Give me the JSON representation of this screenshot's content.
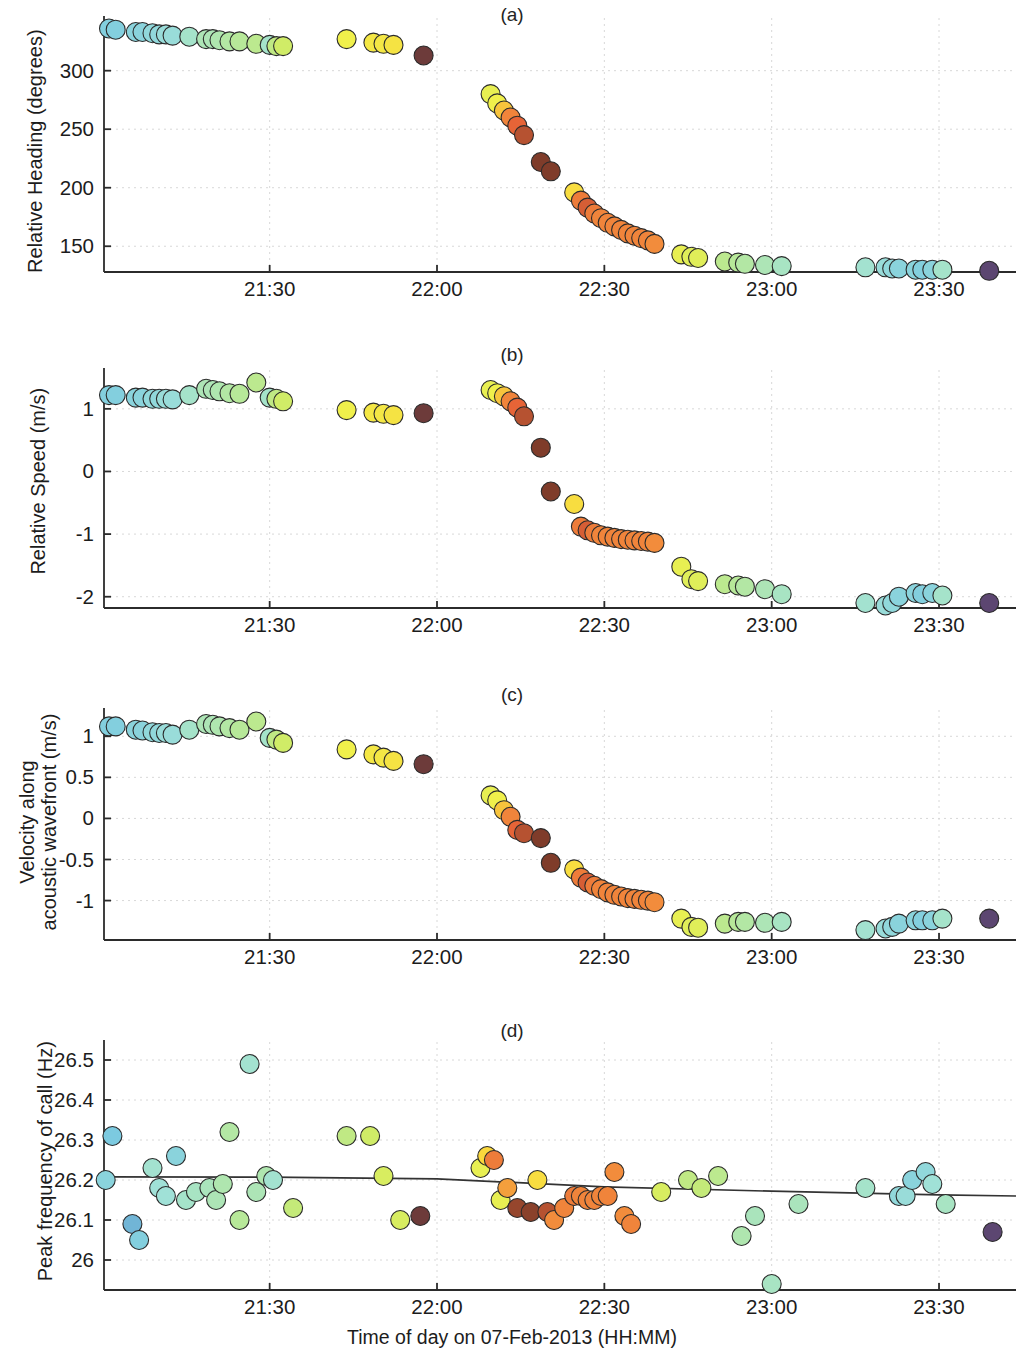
{
  "figure": {
    "xlabel": "Time of day on 07-Feb-2013 (HH:MM)",
    "xticks": [
      "21:30",
      "22:00",
      "22:30",
      "23:00",
      "23:30"
    ],
    "xtick_values": [
      21.5,
      22.0,
      22.5,
      23.0,
      23.5
    ],
    "xlim": [
      21.005,
      23.73
    ],
    "marker_edge_color": "#2b2b2b",
    "axis_color": "#2b2b2b",
    "grid_color": "#d8d8d8",
    "trendline_color": "#333333"
  },
  "panels": {
    "a": {
      "label": "(a)",
      "ylabel": "Relative Heading (degrees)",
      "ylabel_lines": [
        "Relative Heading (degrees)"
      ],
      "yticks": [
        "300",
        "250",
        "200",
        "150"
      ],
      "ytick_values": [
        300,
        250,
        200,
        150
      ]
    },
    "b": {
      "label": "(b)",
      "ylabel": "Relative Speed (m/s)",
      "ylabel_lines": [
        "Relative Speed (m/s)"
      ],
      "yticks": [
        "1",
        "0",
        "-1",
        "-2"
      ],
      "ytick_values": [
        1,
        0,
        -1,
        -2
      ]
    },
    "c": {
      "label": "(c)",
      "ylabel": "Velocity along acoustic wavefront (m/s)",
      "ylabel_lines": [
        "Velocity along",
        "acoustic wavefront (m/s)"
      ],
      "yticks": [
        "1",
        "0.5",
        "0",
        "-0.5",
        "-1"
      ],
      "ytick_values": [
        1,
        0.5,
        0,
        -0.5,
        -1
      ]
    },
    "d": {
      "label": "(d)",
      "ylabel": "Peak frequency of call (Hz)",
      "ylabel_lines": [
        "Peak frequency of call (Hz)"
      ],
      "yticks": [
        "26.5",
        "26.4",
        "26.3",
        "26.2",
        "26.1",
        "26"
      ],
      "ytick_values": [
        26.5,
        26.4,
        26.3,
        26.2,
        26.1,
        26.0
      ]
    }
  },
  "chart_data": [
    {
      "panel": "a",
      "type": "scatter",
      "title": "(a)",
      "xlabel": "Time of day on 07-Feb-2013 (HH:MM)",
      "ylabel": "Relative Heading (degrees)",
      "xlim": [
        21.005,
        23.73
      ],
      "ylim": [
        128,
        345
      ],
      "grid": true,
      "legend": "none",
      "x": [
        21.02,
        21.04,
        21.1,
        21.12,
        21.15,
        21.17,
        21.19,
        21.21,
        21.26,
        21.31,
        21.33,
        21.35,
        21.38,
        21.41,
        21.46,
        21.5,
        21.52,
        21.54,
        21.73,
        21.81,
        21.84,
        21.87,
        21.96,
        22.16,
        22.18,
        22.2,
        22.22,
        22.24,
        22.26,
        22.31,
        22.34,
        22.41,
        22.43,
        22.45,
        22.47,
        22.49,
        22.51,
        22.53,
        22.55,
        22.57,
        22.59,
        22.61,
        22.63,
        22.65,
        22.73,
        22.76,
        22.78,
        22.86,
        22.9,
        22.92,
        22.98,
        23.03,
        23.28,
        23.34,
        23.36,
        23.38,
        23.43,
        23.45,
        23.48,
        23.51,
        23.65
      ],
      "y": [
        336,
        335,
        333,
        333,
        332,
        331,
        331,
        330,
        329,
        327,
        327,
        326,
        325,
        325,
        323,
        322,
        321,
        321,
        327,
        324,
        323,
        322,
        313,
        280,
        272,
        266,
        260,
        253,
        245,
        222,
        214,
        196,
        189,
        183,
        178,
        174,
        170,
        167,
        164,
        161,
        159,
        157,
        155,
        152,
        143,
        141,
        140,
        137,
        136,
        135,
        134,
        133,
        132,
        132,
        131,
        131,
        130,
        130,
        130,
        130,
        129
      ],
      "color_index": [
        0.1,
        0.1,
        0.12,
        0.12,
        0.14,
        0.14,
        0.16,
        0.16,
        0.22,
        0.28,
        0.28,
        0.3,
        0.32,
        0.34,
        0.36,
        0.22,
        0.38,
        0.44,
        0.52,
        0.55,
        0.55,
        0.56,
        0.95,
        0.5,
        0.52,
        0.62,
        0.7,
        0.78,
        0.84,
        0.92,
        0.92,
        0.58,
        0.72,
        0.8,
        0.72,
        0.7,
        0.7,
        0.7,
        0.7,
        0.7,
        0.7,
        0.7,
        0.7,
        0.68,
        0.5,
        0.48,
        0.48,
        0.36,
        0.34,
        0.32,
        0.28,
        0.24,
        0.2,
        0.16,
        0.14,
        0.12,
        0.12,
        0.1,
        0.12,
        0.22,
        0.98
      ]
    },
    {
      "panel": "b",
      "type": "scatter",
      "title": "(b)",
      "xlabel": "Time of day on 07-Feb-2013 (HH:MM)",
      "ylabel": "Relative Speed (m/s)",
      "xlim": [
        21.005,
        23.73
      ],
      "ylim": [
        -2.18,
        1.62
      ],
      "grid": true,
      "legend": "none",
      "x": [
        21.02,
        21.04,
        21.1,
        21.12,
        21.15,
        21.17,
        21.19,
        21.21,
        21.26,
        21.31,
        21.33,
        21.35,
        21.38,
        21.41,
        21.46,
        21.5,
        21.52,
        21.54,
        21.73,
        21.81,
        21.84,
        21.87,
        21.96,
        22.16,
        22.18,
        22.2,
        22.22,
        22.24,
        22.26,
        22.31,
        22.34,
        22.41,
        22.43,
        22.45,
        22.47,
        22.49,
        22.51,
        22.53,
        22.55,
        22.57,
        22.59,
        22.61,
        22.63,
        22.65,
        22.73,
        22.76,
        22.78,
        22.86,
        22.9,
        22.92,
        22.98,
        23.03,
        23.28,
        23.34,
        23.36,
        23.38,
        23.43,
        23.45,
        23.48,
        23.51,
        23.65
      ],
      "y": [
        1.22,
        1.22,
        1.18,
        1.18,
        1.16,
        1.16,
        1.16,
        1.15,
        1.22,
        1.32,
        1.3,
        1.28,
        1.25,
        1.24,
        1.42,
        1.18,
        1.16,
        1.12,
        0.98,
        0.94,
        0.92,
        0.9,
        0.93,
        1.3,
        1.25,
        1.2,
        1.12,
        1.02,
        0.88,
        0.38,
        -0.32,
        -0.52,
        -0.88,
        -0.94,
        -0.98,
        -1.02,
        -1.04,
        -1.06,
        -1.08,
        -1.09,
        -1.1,
        -1.11,
        -1.12,
        -1.14,
        -1.52,
        -1.72,
        -1.75,
        -1.8,
        -1.82,
        -1.84,
        -1.88,
        -1.96,
        -2.1,
        -2.14,
        -2.1,
        -2.0,
        -1.94,
        -1.96,
        -1.94,
        -1.98,
        -2.1
      ],
      "color_index": [
        0.1,
        0.1,
        0.12,
        0.12,
        0.14,
        0.14,
        0.16,
        0.16,
        0.22,
        0.28,
        0.28,
        0.3,
        0.32,
        0.34,
        0.36,
        0.22,
        0.38,
        0.44,
        0.52,
        0.55,
        0.55,
        0.56,
        0.95,
        0.5,
        0.52,
        0.62,
        0.7,
        0.78,
        0.84,
        0.92,
        0.92,
        0.58,
        0.72,
        0.8,
        0.72,
        0.7,
        0.7,
        0.7,
        0.7,
        0.7,
        0.7,
        0.7,
        0.7,
        0.68,
        0.5,
        0.48,
        0.48,
        0.36,
        0.34,
        0.32,
        0.28,
        0.24,
        0.2,
        0.16,
        0.14,
        0.12,
        0.12,
        0.1,
        0.12,
        0.22,
        0.98
      ]
    },
    {
      "panel": "c",
      "type": "scatter",
      "title": "(c)",
      "xlabel": "Time of day on 07-Feb-2013 (HH:MM)",
      "ylabel": "Velocity along acoustic wavefront (m/s)",
      "xlim": [
        21.005,
        23.73
      ],
      "ylim": [
        -1.48,
        1.32
      ],
      "grid": true,
      "legend": "none",
      "x": [
        21.02,
        21.04,
        21.1,
        21.12,
        21.15,
        21.17,
        21.19,
        21.21,
        21.26,
        21.31,
        21.33,
        21.35,
        21.38,
        21.41,
        21.46,
        21.5,
        21.52,
        21.54,
        21.73,
        21.81,
        21.84,
        21.87,
        21.96,
        22.16,
        22.18,
        22.2,
        22.22,
        22.24,
        22.26,
        22.31,
        22.34,
        22.41,
        22.43,
        22.45,
        22.47,
        22.49,
        22.51,
        22.53,
        22.55,
        22.57,
        22.59,
        22.61,
        22.63,
        22.65,
        22.73,
        22.76,
        22.78,
        22.86,
        22.9,
        22.92,
        22.98,
        23.03,
        23.28,
        23.34,
        23.36,
        23.38,
        23.43,
        23.45,
        23.48,
        23.51,
        23.65
      ],
      "y": [
        1.12,
        1.12,
        1.08,
        1.07,
        1.05,
        1.04,
        1.04,
        1.02,
        1.08,
        1.15,
        1.14,
        1.12,
        1.1,
        1.08,
        1.18,
        0.98,
        0.96,
        0.92,
        0.84,
        0.78,
        0.74,
        0.7,
        0.66,
        0.28,
        0.22,
        0.1,
        0.02,
        -0.14,
        -0.18,
        -0.24,
        -0.54,
        -0.62,
        -0.72,
        -0.78,
        -0.82,
        -0.86,
        -0.9,
        -0.93,
        -0.95,
        -0.97,
        -0.98,
        -0.99,
        -1.0,
        -1.02,
        -1.22,
        -1.32,
        -1.33,
        -1.28,
        -1.26,
        -1.26,
        -1.27,
        -1.26,
        -1.36,
        -1.34,
        -1.32,
        -1.28,
        -1.24,
        -1.24,
        -1.24,
        -1.22,
        -1.22
      ],
      "color_index": [
        0.1,
        0.1,
        0.12,
        0.12,
        0.14,
        0.14,
        0.16,
        0.16,
        0.22,
        0.28,
        0.28,
        0.3,
        0.32,
        0.34,
        0.36,
        0.22,
        0.38,
        0.44,
        0.52,
        0.55,
        0.55,
        0.56,
        0.95,
        0.5,
        0.52,
        0.62,
        0.7,
        0.78,
        0.84,
        0.92,
        0.92,
        0.58,
        0.72,
        0.8,
        0.72,
        0.7,
        0.7,
        0.7,
        0.7,
        0.7,
        0.7,
        0.7,
        0.7,
        0.68,
        0.5,
        0.48,
        0.48,
        0.36,
        0.34,
        0.32,
        0.28,
        0.24,
        0.2,
        0.16,
        0.14,
        0.12,
        0.12,
        0.1,
        0.12,
        0.22,
        0.98
      ]
    },
    {
      "panel": "d",
      "type": "scatter",
      "title": "(d)",
      "xlabel": "Time of day on 07-Feb-2013 (HH:MM)",
      "ylabel": "Peak frequency of call (Hz)",
      "xlim": [
        21.005,
        23.73
      ],
      "ylim": [
        25.925,
        26.545
      ],
      "grid": true,
      "legend": "none",
      "trendline": {
        "x": [
          21.005,
          21.5,
          22.0,
          22.5,
          23.0,
          23.5,
          23.73
        ],
        "y": [
          26.208,
          26.207,
          26.203,
          26.183,
          26.172,
          26.163,
          26.16
        ]
      },
      "x": [
        21.01,
        21.03,
        21.09,
        21.11,
        21.15,
        21.17,
        21.19,
        21.22,
        21.25,
        21.28,
        21.32,
        21.34,
        21.36,
        21.38,
        21.41,
        21.44,
        21.46,
        21.49,
        21.51,
        21.57,
        21.73,
        21.8,
        21.84,
        21.89,
        21.95,
        22.13,
        22.15,
        22.17,
        22.19,
        22.21,
        22.24,
        22.28,
        22.3,
        22.33,
        22.35,
        22.38,
        22.41,
        22.43,
        22.45,
        22.47,
        22.49,
        22.51,
        22.53,
        22.56,
        22.58,
        22.67,
        22.75,
        22.79,
        22.84,
        22.91,
        22.95,
        23.0,
        23.08,
        23.28,
        23.38,
        23.4,
        23.42,
        23.46,
        23.48,
        23.52,
        23.66
      ],
      "y": [
        26.2,
        26.31,
        26.09,
        26.05,
        26.23,
        26.18,
        26.16,
        26.26,
        26.15,
        26.17,
        26.18,
        26.15,
        26.19,
        26.32,
        26.1,
        26.49,
        26.17,
        26.21,
        26.2,
        26.13,
        26.31,
        26.31,
        26.21,
        26.1,
        26.11,
        26.23,
        26.26,
        26.25,
        26.15,
        26.18,
        26.13,
        26.12,
        26.2,
        26.12,
        26.1,
        26.13,
        26.16,
        26.16,
        26.15,
        26.15,
        26.16,
        26.16,
        26.22,
        26.11,
        26.09,
        26.17,
        26.2,
        26.18,
        26.21,
        26.06,
        26.11,
        25.94,
        26.14,
        26.18,
        26.16,
        26.16,
        26.2,
        26.22,
        26.19,
        26.14,
        26.07
      ],
      "color_index": [
        0.12,
        0.08,
        0.06,
        0.1,
        0.2,
        0.18,
        0.18,
        0.12,
        0.22,
        0.24,
        0.26,
        0.28,
        0.3,
        0.32,
        0.34,
        0.2,
        0.28,
        0.3,
        0.2,
        0.4,
        0.38,
        0.44,
        0.46,
        0.46,
        0.95,
        0.5,
        0.6,
        0.72,
        0.5,
        0.66,
        0.88,
        0.9,
        0.58,
        0.84,
        0.68,
        0.7,
        0.72,
        0.7,
        0.7,
        0.7,
        0.7,
        0.7,
        0.68,
        0.68,
        0.7,
        0.46,
        0.38,
        0.4,
        0.36,
        0.3,
        0.26,
        0.24,
        0.26,
        0.22,
        0.14,
        0.16,
        0.12,
        0.14,
        0.18,
        0.24,
        0.98
      ]
    }
  ]
}
